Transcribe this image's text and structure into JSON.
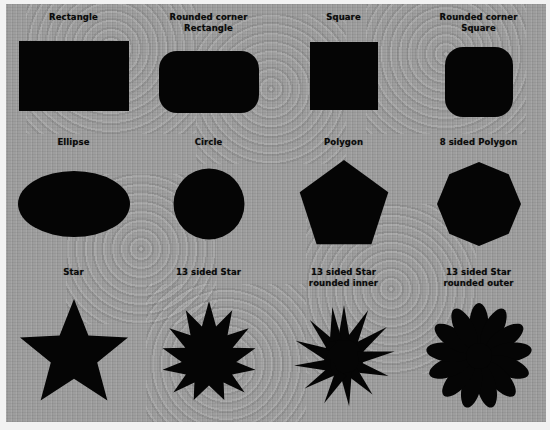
{
  "figure": {
    "background_color": "#9b9b9b",
    "shape_color": "#050505",
    "label_color": "#0a0a0a",
    "frame_color": "#f2f2f2",
    "columns": 4,
    "rows": 3
  },
  "cells": [
    {
      "id": "rectangle",
      "label": "Rectangle",
      "shape": "rect",
      "row": 1,
      "column": 1
    },
    {
      "id": "rounded-corner-rectangle",
      "label": "Rounded corner\nRectangle",
      "shape": "rounded-rect",
      "row": 1,
      "column": 2
    },
    {
      "id": "square",
      "label": "Square",
      "shape": "square",
      "row": 1,
      "column": 3
    },
    {
      "id": "rounded-corner-square",
      "label": "Rounded corner\nSquare",
      "shape": "rounded-square",
      "row": 1,
      "column": 4
    },
    {
      "id": "ellipse",
      "label": "Ellipse",
      "shape": "ellipse",
      "row": 2,
      "column": 1
    },
    {
      "id": "circle",
      "label": "Circle",
      "shape": "circle",
      "row": 2,
      "column": 2
    },
    {
      "id": "polygon",
      "label": "Polygon",
      "shape": "pentagon",
      "row": 2,
      "column": 3
    },
    {
      "id": "8-sided-polygon",
      "label": "8 sided Polygon",
      "shape": "octagon",
      "row": 2,
      "column": 4
    },
    {
      "id": "star",
      "label": "Star",
      "shape": "star-5",
      "row": 3,
      "column": 1
    },
    {
      "id": "13-sided-star",
      "label": "13 sided Star",
      "shape": "star-13",
      "row": 3,
      "column": 2
    },
    {
      "id": "13-sided-star-rounded-inner",
      "label": "13 sided Star\nrounded inner",
      "shape": "star-13-rounded-inner",
      "row": 3,
      "column": 3
    },
    {
      "id": "13-sided-star-rounded-outer",
      "label": "13 sided Star\nrounded outer",
      "shape": "star-13-rounded-outer",
      "row": 3,
      "column": 4
    }
  ]
}
